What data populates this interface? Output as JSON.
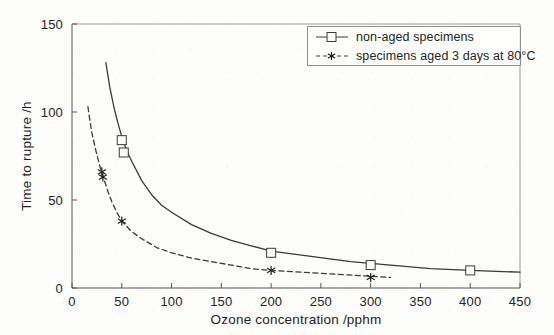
{
  "chart_data": {
    "type": "line",
    "title": "",
    "xlabel": "Ozone concentration /pphm",
    "ylabel": "Time to rupture /h",
    "xlim": [
      0,
      450
    ],
    "ylim": [
      0,
      150
    ],
    "xticks": [
      0,
      50,
      100,
      150,
      200,
      250,
      300,
      350,
      400,
      450
    ],
    "yticks": [
      0,
      50,
      100,
      150
    ],
    "grid": false,
    "legend_position": "top-right",
    "series": [
      {
        "name": "non-aged specimens",
        "marker": "square",
        "linestyle": "solid",
        "color": "#3a3a3a",
        "points": [
          {
            "x": 50,
            "y": 84
          },
          {
            "x": 52,
            "y": 77
          },
          {
            "x": 200,
            "y": 20
          },
          {
            "x": 300,
            "y": 13
          },
          {
            "x": 400,
            "y": 10
          }
        ],
        "fit_curve": [
          {
            "x": 34,
            "y": 128
          },
          {
            "x": 38,
            "y": 114
          },
          {
            "x": 42,
            "y": 103
          },
          {
            "x": 46,
            "y": 94
          },
          {
            "x": 50,
            "y": 86
          },
          {
            "x": 55,
            "y": 78
          },
          {
            "x": 60,
            "y": 72
          },
          {
            "x": 70,
            "y": 61
          },
          {
            "x": 80,
            "y": 53
          },
          {
            "x": 90,
            "y": 47
          },
          {
            "x": 100,
            "y": 43
          },
          {
            "x": 120,
            "y": 36
          },
          {
            "x": 140,
            "y": 31
          },
          {
            "x": 160,
            "y": 27
          },
          {
            "x": 180,
            "y": 24
          },
          {
            "x": 200,
            "y": 21
          },
          {
            "x": 240,
            "y": 18
          },
          {
            "x": 280,
            "y": 15
          },
          {
            "x": 320,
            "y": 13
          },
          {
            "x": 360,
            "y": 11
          },
          {
            "x": 400,
            "y": 10
          },
          {
            "x": 450,
            "y": 9
          }
        ]
      },
      {
        "name": "specimens aged 3 days at 80°C",
        "marker": "star",
        "linestyle": "dashed",
        "color": "#3a3a3a",
        "points": [
          {
            "x": 30,
            "y": 66
          },
          {
            "x": 31,
            "y": 63
          },
          {
            "x": 50,
            "y": 38
          },
          {
            "x": 200,
            "y": 10
          },
          {
            "x": 300,
            "y": 6
          }
        ],
        "fit_curve": [
          {
            "x": 16,
            "y": 103
          },
          {
            "x": 18,
            "y": 95
          },
          {
            "x": 20,
            "y": 88
          },
          {
            "x": 24,
            "y": 78
          },
          {
            "x": 28,
            "y": 69
          },
          {
            "x": 32,
            "y": 62
          },
          {
            "x": 36,
            "y": 55
          },
          {
            "x": 40,
            "y": 49
          },
          {
            "x": 45,
            "y": 43
          },
          {
            "x": 50,
            "y": 38
          },
          {
            "x": 60,
            "y": 32
          },
          {
            "x": 70,
            "y": 28
          },
          {
            "x": 85,
            "y": 23
          },
          {
            "x": 100,
            "y": 20
          },
          {
            "x": 120,
            "y": 17
          },
          {
            "x": 140,
            "y": 15
          },
          {
            "x": 160,
            "y": 13
          },
          {
            "x": 180,
            "y": 11
          },
          {
            "x": 200,
            "y": 10
          },
          {
            "x": 230,
            "y": 9
          },
          {
            "x": 260,
            "y": 8
          },
          {
            "x": 290,
            "y": 7
          },
          {
            "x": 320,
            "y": 6
          }
        ]
      }
    ]
  },
  "axes": {
    "x_title": "Ozone concentration /pphm",
    "y_title": "Time to rupture /h",
    "x_tick_labels": [
      "0",
      "50",
      "100",
      "150",
      "200",
      "250",
      "300",
      "350",
      "400",
      "450"
    ],
    "y_tick_labels": [
      "0",
      "50",
      "100",
      "150"
    ],
    "origin_label": "0"
  },
  "legend": {
    "entries": [
      {
        "label": "non-aged specimens",
        "marker": "square-marker",
        "line": "solid"
      },
      {
        "label": "specimens aged 3 days at 80°C",
        "marker": "star-marker",
        "line": "dashed"
      }
    ]
  },
  "style": {
    "axis_color": "#555555",
    "curve_color": "#3a3a3a",
    "background": "#fdfdfc",
    "text_color": "#232323"
  }
}
